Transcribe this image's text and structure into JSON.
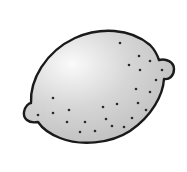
{
  "image": {
    "subject": "lemon",
    "style": "grayscale clip-art illustration",
    "alt": "Line drawing of a lemon with dotted peel texture"
  },
  "colors": {
    "background": "#ffffff",
    "outline": "#1a1a1a",
    "fill_highlight": "#fafafa",
    "fill_mid": "#d6d6d6",
    "fill_shadow": "#b9b9b9",
    "dot": "#2a2a2a"
  },
  "lemon": {
    "outline_width": 2.4,
    "dot_radius": 1.3,
    "dots": [
      [
        120,
        43
      ],
      [
        139,
        56
      ],
      [
        150,
        61
      ],
      [
        129,
        65
      ],
      [
        140,
        70
      ],
      [
        162,
        70
      ],
      [
        156,
        80
      ],
      [
        136,
        89
      ],
      [
        150,
        92
      ],
      [
        53,
        98
      ],
      [
        103,
        107
      ],
      [
        117,
        104
      ],
      [
        138,
        103
      ],
      [
        146,
        110
      ],
      [
        69,
        110
      ],
      [
        53,
        113
      ],
      [
        38,
        115
      ],
      [
        106,
        119
      ],
      [
        132,
        118
      ],
      [
        67,
        122
      ],
      [
        85,
        122
      ],
      [
        112,
        126
      ],
      [
        124,
        127
      ],
      [
        95,
        131
      ],
      [
        80,
        132
      ]
    ]
  }
}
